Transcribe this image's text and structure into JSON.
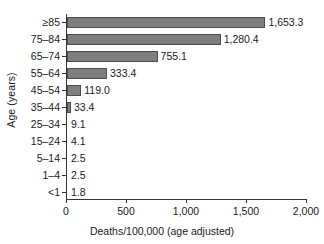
{
  "chart_data": {
    "type": "bar",
    "orientation": "horizontal",
    "title": "",
    "xlabel": "Deaths/100,000 (age adjusted)",
    "ylabel": "Age (years)",
    "categories": [
      "≥85",
      "75–84",
      "65–74",
      "55–64",
      "45–54",
      "35–44",
      "25–34",
      "15–24",
      "5–14",
      "1–4",
      "<1"
    ],
    "values": [
      1653.3,
      1280.4,
      755.1,
      333.4,
      119.0,
      33.4,
      9.1,
      4.1,
      2.5,
      2.5,
      1.8
    ],
    "value_labels": [
      "1,653.3",
      "1,280.4",
      "755.1",
      "333.4",
      "119.0",
      "33.4",
      "9.1",
      "4.1",
      "2.5",
      "2.5",
      "1.8"
    ],
    "xlim": [
      0,
      2000
    ],
    "xticks": [
      0,
      500,
      1000,
      1500,
      2000
    ],
    "xtick_labels": [
      "0",
      "500",
      "1,000",
      "1,500",
      "2,000"
    ],
    "grid": false,
    "legend": null,
    "bar_color": "#7e7e7e",
    "bar_edge_color": "#4d4d4d",
    "axis_color": "#333333"
  }
}
